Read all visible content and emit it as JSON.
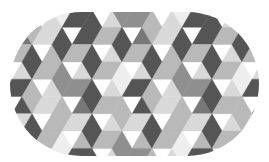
{
  "image": {
    "description": "Stadium (pill) shape filled with grayscale tumbling-blocks rhombus pattern",
    "width": 269,
    "height": 162,
    "background": "#ffffff"
  },
  "shape": {
    "type": "stadium",
    "x": 10,
    "y": 12,
    "width": 249,
    "height": 144,
    "radius": 72
  },
  "pattern": {
    "type": "tumbling-blocks",
    "triangle_side": 20,
    "row_height": 17.3,
    "offset_x": 2,
    "offset_y": 10,
    "palette": {
      "dark": "#555555",
      "mid_dark": "#777777",
      "mid": "#8f8f8f",
      "light_mid": "#b9b9b9",
      "light": "#d9d9d9",
      "lightest": "#eeeeee"
    },
    "shading_by_orientation": {
      "vertical_diamond": [
        "mid",
        "dark",
        "lightest",
        "light_mid"
      ],
      "left_parallelogram": [
        "dark",
        "light_mid",
        "mid_dark",
        "light"
      ],
      "right_parallelogram": [
        "light",
        "mid",
        "light_mid",
        "dark"
      ]
    }
  }
}
